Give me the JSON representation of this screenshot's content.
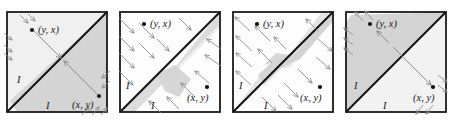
{
  "figure": {
    "name": "four-panel-diagram",
    "background_color": "#ffffff",
    "panel_border_color": "#1a1a1a",
    "diagonal_color": "#111111",
    "arrow_color": "#8a8a8a",
    "point_color": "#111111",
    "fill_light": "#ececec",
    "fill_mid": "#d9d9d9",
    "fill_dark": "#cfcfcf",
    "panel_count": 4,
    "panel_size": 106
  },
  "labels": {
    "point_upper": "(y, x)",
    "point_lower": "(x, y)",
    "region_upper": "I",
    "region_lower": "I",
    "point_upper_parts": {
      "open": "(",
      "first": "y",
      "comma": ", ",
      "second": "x",
      "close": ")"
    },
    "point_lower_parts": {
      "open": "(",
      "first": "x",
      "comma": ", ",
      "second": "y",
      "close": ")"
    }
  },
  "panels": [
    {
      "id": "panel-1",
      "index": 1,
      "description": "shaded quadrilateral below diagonal, arrows converging inward toward diagonal",
      "point_upper": "(y, x)",
      "point_lower": "(x, y)",
      "region_upper": "I",
      "region_lower": "I",
      "arrow_mode": "inward",
      "fill_regions": [
        "lower-right-wedge"
      ]
    },
    {
      "id": "panel-2",
      "index": 2,
      "description": "lens shaped shaded band straddling diagonal, parallel arrows pointing toward diagonal from both sides",
      "point_upper": "(y, x)",
      "point_lower": "(x, y)",
      "region_upper": "I",
      "region_lower": "I",
      "arrow_mode": "converging",
      "fill_regions": [
        "diagonal-lens"
      ]
    },
    {
      "id": "panel-3",
      "index": 3,
      "description": "bowtie shaded band across diagonal, parallel arrows pointing away from diagonal",
      "point_upper": "(y, x)",
      "point_lower": "(x, y)",
      "region_upper": "I",
      "region_lower": "I",
      "arrow_mode": "diverging",
      "fill_regions": [
        "diagonal-bowtie"
      ]
    },
    {
      "id": "panel-4",
      "index": 4,
      "description": "upper-left triangle shaded darker, lower-right triangle pale, arrows pointing outward at corners",
      "point_upper": "(y, x)",
      "point_lower": "(x, y)",
      "region_upper": "I",
      "region_lower": "I",
      "arrow_mode": "outward",
      "fill_regions": [
        "upper-left-triangle",
        "lower-right-triangle"
      ]
    }
  ]
}
